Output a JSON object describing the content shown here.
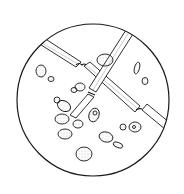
{
  "figure": {
    "description": "Microscope-field illustration of fungal hyphae with budding yeast cells",
    "colors": {
      "background": "#ffffff",
      "ink": "#1a1a1a",
      "shade": "#9a9a9a"
    },
    "field": {
      "cx": 93,
      "cy": 100,
      "r": 76
    }
  }
}
